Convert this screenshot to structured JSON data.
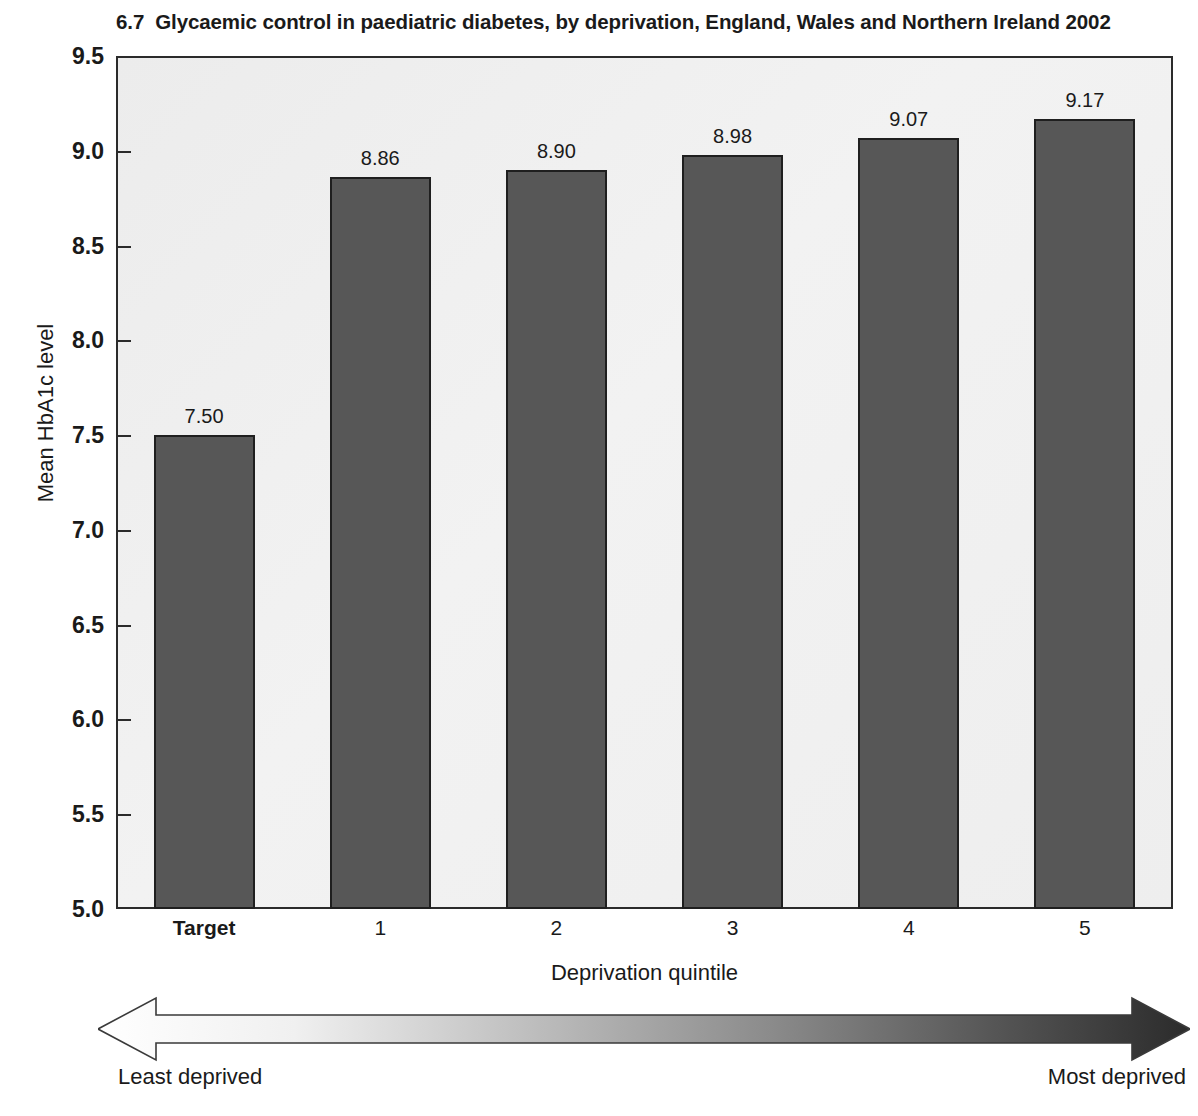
{
  "figure": {
    "number": "6.7",
    "title": "Glycaemic control in paediatric diabetes, by deprivation, England, Wales and Northern Ireland 2002"
  },
  "chart_data": {
    "type": "bar",
    "xlabel": "Deprivation quintile",
    "ylabel": "Mean HbA1c level",
    "categories": [
      "Target",
      "1",
      "2",
      "3",
      "4",
      "5"
    ],
    "values": [
      7.5,
      8.86,
      8.9,
      8.98,
      9.07,
      9.17
    ],
    "value_labels": [
      "7.50",
      "8.86",
      "8.90",
      "8.98",
      "9.07",
      "9.17"
    ],
    "ylim": [
      5.0,
      9.5
    ],
    "yticks": [
      5.0,
      5.5,
      6.0,
      6.5,
      7.0,
      7.5,
      8.0,
      8.5,
      9.0,
      9.5
    ],
    "ytick_labels": [
      "5.0",
      "5.5",
      "6.0",
      "6.5",
      "7.0",
      "7.5",
      "8.0",
      "8.5",
      "9.0",
      "9.5"
    ],
    "grid": false,
    "legend": null,
    "bar_color": "#575757",
    "bar_edge_color": "#1f1f1f",
    "plot_background": "#eeeeee",
    "annotations": {
      "arrow_left_label": "Least deprived",
      "arrow_right_label": "Most deprived",
      "arrow_gradient_from": "#ffffff",
      "arrow_gradient_to": "#2f2f2f"
    }
  },
  "axes": {
    "y_title": "Mean HbA1c level",
    "x_title": "Deprivation quintile",
    "y_ticks": [
      "9.5",
      "9.0",
      "8.5",
      "8.0",
      "7.5",
      "7.0",
      "6.5",
      "6.0",
      "5.5",
      "5.0"
    ],
    "x_ticks": [
      "Target",
      "1",
      "2",
      "3",
      "4",
      "5"
    ]
  },
  "bars": [
    {
      "category": "Target",
      "value_label": "7.50"
    },
    {
      "category": "1",
      "value_label": "8.86"
    },
    {
      "category": "2",
      "value_label": "8.90"
    },
    {
      "category": "3",
      "value_label": "8.98"
    },
    {
      "category": "4",
      "value_label": "9.07"
    },
    {
      "category": "5",
      "value_label": "9.17"
    }
  ],
  "arrow": {
    "left_label": "Least deprived",
    "right_label": "Most deprived"
  }
}
